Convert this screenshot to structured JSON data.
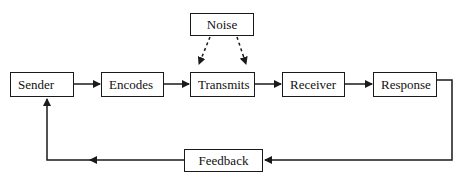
{
  "diagram": {
    "type": "communication-process-flow",
    "nodes": [
      {
        "id": "sender",
        "label": "Sender"
      },
      {
        "id": "encodes",
        "label": "Encodes"
      },
      {
        "id": "transmits",
        "label": "Transmits"
      },
      {
        "id": "receiver",
        "label": "Receiver"
      },
      {
        "id": "response",
        "label": "Response"
      },
      {
        "id": "noise",
        "label": "Noise"
      },
      {
        "id": "feedback",
        "label": "Feedback"
      }
    ],
    "edges": [
      {
        "from": "sender",
        "to": "encodes",
        "style": "solid"
      },
      {
        "from": "encodes",
        "to": "transmits",
        "style": "solid"
      },
      {
        "from": "transmits",
        "to": "receiver",
        "style": "solid"
      },
      {
        "from": "receiver",
        "to": "response",
        "style": "solid"
      },
      {
        "from": "noise",
        "to": "transmits",
        "style": "dashed",
        "count": 2
      },
      {
        "from": "response",
        "to": "feedback",
        "style": "solid"
      },
      {
        "from": "feedback",
        "to": "sender",
        "style": "solid"
      }
    ],
    "colors": {
      "line": "#1a1a1a",
      "background": "#ffffff"
    }
  }
}
